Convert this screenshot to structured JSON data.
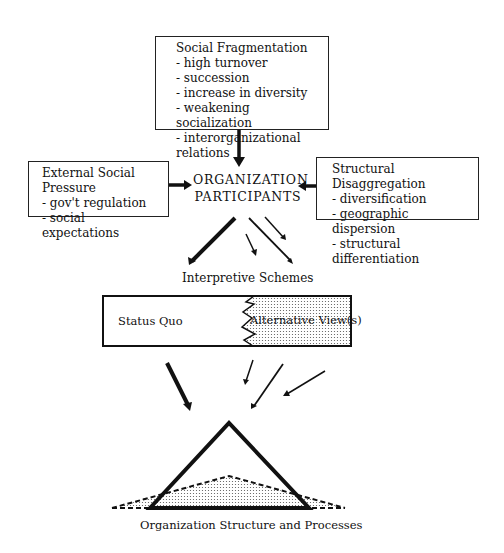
{
  "diagram": {
    "social_fragmentation": {
      "title": "Social Fragmentation",
      "items": [
        "- high turnover",
        "- succession",
        "- increase in diversity",
        "- weakening socialization",
        "- interorganizational relations"
      ]
    },
    "external_social_pressure": {
      "title": "External Social Pressure",
      "items": [
        "- gov't regulation",
        "- social expectations"
      ]
    },
    "structural_disaggregation": {
      "title": "Structural Disaggregation",
      "items": [
        "- diversification",
        "- geographic dispersion",
        "- structural differentiation"
      ]
    },
    "center": {
      "line1": "ORGANIZATION",
      "line2": "PARTICIPANTS"
    },
    "interpretive_schemes": "Interpretive Schemes",
    "status_quo": "Status Quo",
    "alternative_views": "Alternative View(s)",
    "bottom_label": "Organization Structure and Processes"
  }
}
